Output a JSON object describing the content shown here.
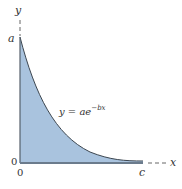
{
  "figure": {
    "type": "area-under-curve",
    "equation": {
      "lhs": "y = ae",
      "exponent": "−bx"
    },
    "axes": {
      "y_label": "y",
      "x_label": "x",
      "origin_labels": [
        "0",
        "0"
      ]
    },
    "points": {
      "y_intercept_label": "a",
      "x_end_label": "c"
    },
    "colors": {
      "fill": "#a9c3de",
      "edge": "#5f6f80",
      "axis": "#666666"
    }
  }
}
